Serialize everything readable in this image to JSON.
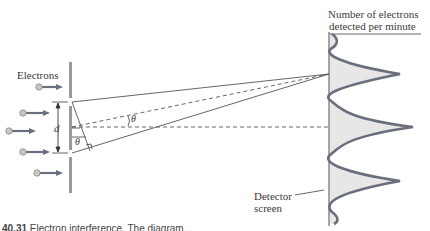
{
  "labels": {
    "electrons": "Electrons",
    "slit_separation": "d",
    "angle_upper": "θ",
    "angle_lower": "θ",
    "detector_line1": "Detector",
    "detector_line2": "screen",
    "graph_title_line1": "Number of electrons",
    "graph_title_line2": "detected per minute"
  },
  "caption": {
    "number": "40.31",
    "text": "Electron interference. The diagram..."
  },
  "colors": {
    "curve": "#6a6f7e",
    "fill": "#e7e7e7",
    "line": "#555555",
    "barrier": "#8a8a8a",
    "electron": "#bdbdbd"
  },
  "diagram": {
    "electron_count": 5,
    "slits": 2,
    "intensity_peaks": 3
  }
}
